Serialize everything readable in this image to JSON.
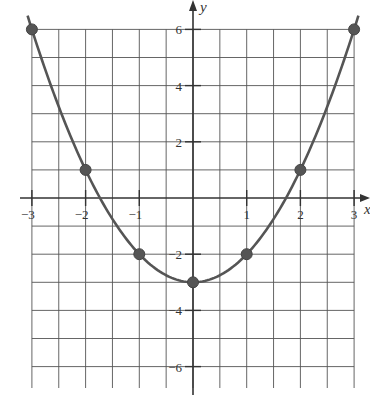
{
  "chart_data": {
    "type": "line",
    "title": "",
    "function": "y = x^2 - 3",
    "xlabel": "x",
    "ylabel": "y",
    "xlim": [
      -3,
      3
    ],
    "ylim": [
      -7.5,
      6.5
    ],
    "grid": true,
    "x_ticks": [
      -3,
      -2,
      -1,
      1,
      2,
      3
    ],
    "x_tick_labels": [
      "-3",
      "-2",
      "-1",
      "1",
      "2",
      "3"
    ],
    "y_ticks": [
      6,
      4,
      2,
      -2,
      -4,
      -6
    ],
    "y_tick_labels": [
      "6",
      "4",
      "2",
      "-2",
      "-4",
      "-6"
    ],
    "points": [
      {
        "x": -3,
        "y": 6
      },
      {
        "x": -2,
        "y": 1
      },
      {
        "x": -1,
        "y": -2
      },
      {
        "x": 0,
        "y": -3
      },
      {
        "x": 1,
        "y": -2
      },
      {
        "x": 2,
        "y": 1
      },
      {
        "x": 3,
        "y": 6
      }
    ],
    "series": [
      {
        "name": "parabola",
        "x": [
          -3,
          -2,
          -1,
          0,
          1,
          2,
          3
        ],
        "values": [
          6,
          1,
          -2,
          -3,
          -2,
          1,
          6
        ]
      }
    ]
  },
  "colors": {
    "curve": "#555555",
    "grid": "#555555",
    "background": "#ffffff"
  }
}
